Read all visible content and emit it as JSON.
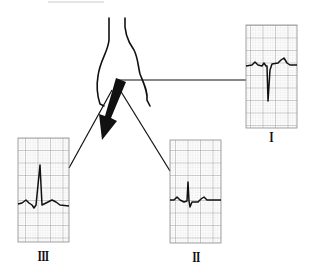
{
  "diagram": {
    "type": "ecg-limb-lead-axis",
    "colors": {
      "ink": "#111111",
      "grid_minor": "#c8c8c8",
      "grid_major": "#8a8a8a",
      "paper": "#f4f4f4",
      "top_rule": "#dddddd"
    },
    "vector_arrow": {
      "direction": "down-left",
      "description": "thick black mean QRS axis arrow"
    },
    "leads": [
      {
        "id": "I",
        "label": "I",
        "qrs": "predominantly negative (deep S)"
      },
      {
        "id": "II",
        "label": "II",
        "qrs": "small biphasic (R then S)"
      },
      {
        "id": "III",
        "label": "III",
        "qrs": "predominantly positive (tall R)"
      }
    ]
  }
}
